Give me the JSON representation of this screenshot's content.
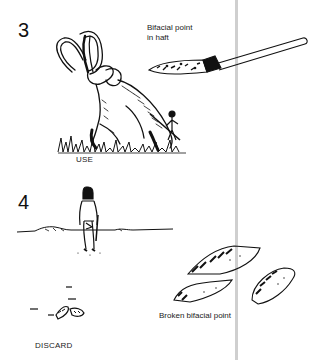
{
  "figure": {
    "panels": [
      {
        "step": "3",
        "caption": "USE",
        "callout": "Bifacial point in haft",
        "callout_lines": [
          "Bifacial point",
          "in haft"
        ],
        "illustrations": [
          "mammoth",
          "hunter-with-spear",
          "hafted-bifacial-point"
        ]
      },
      {
        "step": "4",
        "caption": "DISCARD",
        "callout": "Broken bifacial point",
        "illustrations": [
          "walking-hunter",
          "horizon-landscape",
          "discarded-fragments",
          "broken-point-fragment-1",
          "broken-point-fragment-2",
          "broken-point-fragment-3"
        ]
      }
    ]
  }
}
